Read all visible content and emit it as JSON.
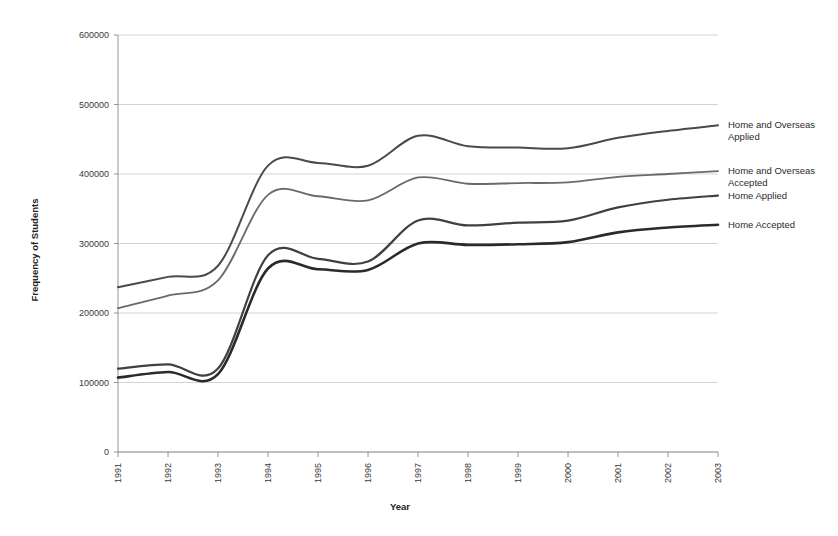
{
  "chart_data": {
    "type": "line",
    "title": "",
    "xlabel": "Year",
    "ylabel": "Frequency of Students",
    "x": [
      1991,
      1992,
      1993,
      1994,
      1995,
      1996,
      1997,
      1998,
      1999,
      2000,
      2001,
      2002,
      2003
    ],
    "xtick_labels": [
      "1991",
      "1992",
      "1993",
      "1994",
      "1995",
      "1996",
      "1997",
      "1998",
      "1999",
      "2000",
      "2001",
      "2002",
      "2003"
    ],
    "ytick_labels": [
      "0",
      "100000",
      "200000",
      "300000",
      "400000",
      "500000",
      "600000"
    ],
    "yticks": [
      0,
      100000,
      200000,
      300000,
      400000,
      500000,
      600000
    ],
    "ylim": [
      0,
      600000
    ],
    "xlim": [
      1991,
      2003
    ],
    "grid": "horizontal",
    "legend_position": "right-outside-at-line-end",
    "series": [
      {
        "name": "Home and Overseas Applied",
        "color": "#4a4a4a",
        "width": 2.0,
        "values": [
          237000,
          252000,
          268000,
          412000,
          416000,
          412000,
          455000,
          440000,
          438000,
          437000,
          452000,
          462000,
          470000
        ]
      },
      {
        "name": "Home and Overseas Accepted",
        "color": "#6a6a6a",
        "width": 1.8,
        "values": [
          207000,
          225000,
          247000,
          370000,
          368000,
          362000,
          395000,
          386000,
          387000,
          388000,
          396000,
          400000,
          404000
        ]
      },
      {
        "name": "Home Applied",
        "color": "#404040",
        "width": 2.2,
        "values": [
          120000,
          126000,
          120000,
          283000,
          278000,
          274000,
          333000,
          326000,
          330000,
          333000,
          352000,
          363000,
          369000
        ]
      },
      {
        "name": "Home Accepted",
        "color": "#2a2a2a",
        "width": 2.6,
        "values": [
          107000,
          115000,
          112000,
          264000,
          263000,
          262000,
          300000,
          298000,
          299000,
          302000,
          316000,
          323000,
          327000
        ]
      }
    ]
  },
  "legend": {
    "items": [
      {
        "label_line1": "Home and Overseas",
        "label_line2": "Applied"
      },
      {
        "label_line1": "Home and Overseas",
        "label_line2": "Accepted"
      },
      {
        "label_line1": "Home Applied",
        "label_line2": ""
      },
      {
        "label_line1": "Home Accepted",
        "label_line2": ""
      }
    ]
  },
  "axes": {
    "x_title": "Year",
    "y_title": "Frequency of Students"
  },
  "colors": {
    "gridline": "#c8c8c8",
    "axis": "#8a8a8a",
    "text": "#2b2b2b",
    "background": "#ffffff"
  }
}
